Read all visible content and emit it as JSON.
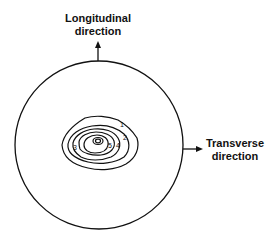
{
  "labels": {
    "longitudinal_line1": "Longitudinal",
    "longitudinal_line2": "direction",
    "transverse_line1": "Transverse",
    "transverse_line2": "direction"
  },
  "contour_levels": [
    "1",
    "2",
    "3",
    "4",
    "5"
  ],
  "colors": {
    "line": "#111111",
    "background": "#ffffff"
  }
}
